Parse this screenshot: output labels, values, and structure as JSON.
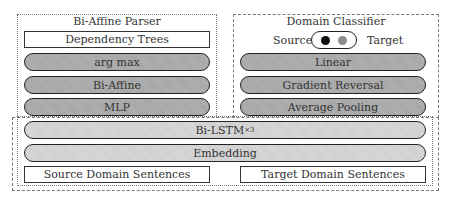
{
  "parser": {
    "title": "Bi-Affine Parser",
    "output": "Dependency Trees",
    "layers": [
      "arg max",
      "Bi-Affine",
      "MLP"
    ]
  },
  "classifier": {
    "title": "Domain Classifier",
    "toggle": {
      "left_label": "Source",
      "right_label": "Target",
      "source_color": "#111111",
      "target_color": "#8c8c8c"
    },
    "layers": [
      "Linear",
      "Gradient Reversal",
      "Average Pooling"
    ]
  },
  "encoder": {
    "bilstm": "Bi-LSTM",
    "bilstm_sup": "×3",
    "embedding": "Embedding"
  },
  "inputs": {
    "source": "Source Domain Sentences",
    "target": "Target Domain Sentences"
  },
  "colors": {
    "dark_layer": "#a8a8a8",
    "light_layer": "#d2d2d2",
    "border": "#222222"
  }
}
